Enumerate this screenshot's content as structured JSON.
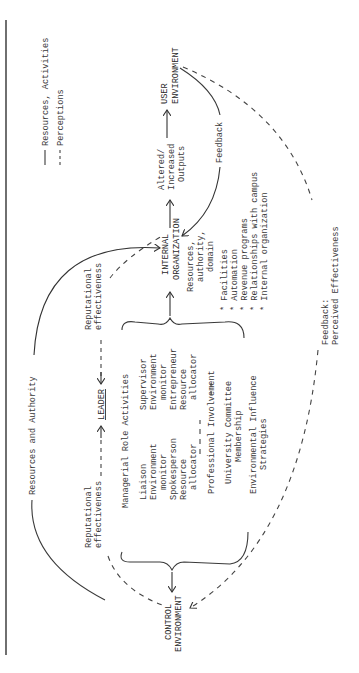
{
  "legend": {
    "solid_label": "Resources, Activities",
    "dashed_label": "Perceptions"
  },
  "nodes": {
    "user_environment": [
      "USER",
      "ENVIRONMENT"
    ],
    "internal_organization": [
      "INTERNAL",
      "ORGANIZATION"
    ],
    "leader": "LEADER",
    "control_environment": [
      "CONTROL",
      "ENVIRONMENT"
    ]
  },
  "edges": {
    "outputs": [
      "Altered/",
      "Increased",
      "Outputs"
    ],
    "feedback": "Feedback",
    "resources_authority": "Resources and Authority",
    "rep_eff_left": [
      "Reputational",
      "effectiveness"
    ],
    "rep_eff_right": [
      "Reputational",
      "effectiveness"
    ],
    "resources_domain": [
      "Resources,",
      "authority,",
      "domain"
    ],
    "perceived_feedback": [
      "Feedback:",
      "Perceived Effectiveness"
    ]
  },
  "internal_items": [
    "* Facilities",
    "* Automation",
    "* Revenue programs",
    "* Relationships with campus",
    "* Internal organization"
  ],
  "managerial": {
    "title": "Managerial Role Activities",
    "left_col": [
      "Liaison",
      "Environment",
      "  monitor",
      "Spokesperson",
      "Resource",
      "  allocator"
    ],
    "right_col": [
      "Supervisor",
      "Environment",
      "  monitor",
      "Entrepreneur",
      "Resource",
      "  allocator"
    ],
    "professional": "Professional Involvement",
    "committee": [
      "University Committee",
      "Membership"
    ],
    "influence": [
      "Environmental Influence",
      "Strategies"
    ]
  }
}
